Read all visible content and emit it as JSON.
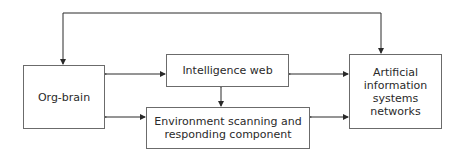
{
  "diagram": {
    "nodes": [
      {
        "id": "org-brain",
        "label": "Org-brain"
      },
      {
        "id": "intelligence-web",
        "label": "Intelligence web"
      },
      {
        "id": "environment",
        "label": "Environment scanning and\nresponding component"
      },
      {
        "id": "ais-networks",
        "label": "Artificial\ninformation\nsystems\nnetworks"
      }
    ],
    "edges": [
      {
        "from": "org-brain",
        "to": "intelligence-web",
        "type": "bidirectional"
      },
      {
        "from": "org-brain",
        "to": "environment",
        "type": "bidirectional"
      },
      {
        "from": "intelligence-web",
        "to": "environment",
        "type": "bidirectional"
      },
      {
        "from": "intelligence-web",
        "to": "ais-networks",
        "type": "bidirectional"
      },
      {
        "from": "environment",
        "to": "ais-networks",
        "type": "bidirectional"
      },
      {
        "from": "org-brain",
        "to": "ais-networks",
        "type": "bidirectional-loop-top"
      }
    ],
    "colors": {
      "line": "#2a2a2a",
      "border": "#6b6b6b"
    }
  }
}
